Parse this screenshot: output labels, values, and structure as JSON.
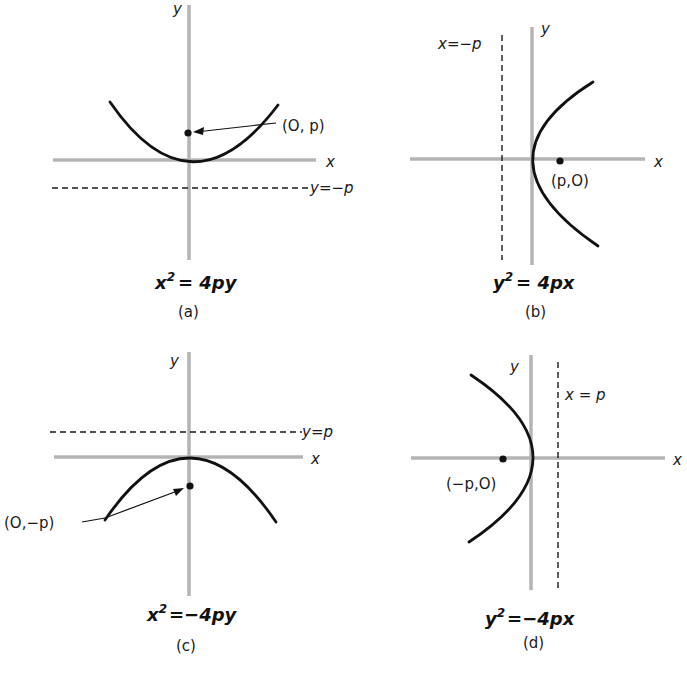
{
  "figure": {
    "panels": [
      {
        "id": "a",
        "caption": "(a)",
        "equation": "x² = 4py",
        "equation_base": "x",
        "equation_sup": "2",
        "equation_rest": "= 4py",
        "x_axis_label": "x",
        "y_axis_label": "y",
        "directrix_label": "y=−p",
        "focus_label": "(O, p)",
        "opens": "up"
      },
      {
        "id": "b",
        "caption": "(b)",
        "equation": "y² = 4px",
        "equation_base": "y",
        "equation_sup": "2",
        "equation_rest": "= 4px",
        "x_axis_label": "x",
        "y_axis_label": "y",
        "directrix_label": "x=−p",
        "focus_label": "(p,O)",
        "opens": "right"
      },
      {
        "id": "c",
        "caption": "(c)",
        "equation": "x² = −4py",
        "equation_base": "x",
        "equation_sup": "2",
        "equation_rest": "=−4py",
        "x_axis_label": "x",
        "y_axis_label": "y",
        "directrix_label": "y=p",
        "focus_label": "(O,−p)",
        "opens": "down"
      },
      {
        "id": "d",
        "caption": "(d)",
        "equation": "y² = −4px",
        "equation_base": "y",
        "equation_sup": "2",
        "equation_rest": "=−4px",
        "x_axis_label": "x",
        "y_axis_label": "y",
        "directrix_label": "x = p",
        "focus_label": "(−p,O)",
        "opens": "left"
      }
    ]
  },
  "colors": {
    "axis": "#b4b4b4",
    "curve": "#111111",
    "background": "#ffffff"
  }
}
